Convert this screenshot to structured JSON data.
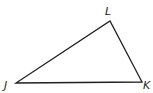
{
  "figure": {
    "type": "triangle",
    "stroke_color": "#231f20",
    "background": "#ffffff",
    "vertices": [
      {
        "name": "J",
        "x": 16,
        "y": 83
      },
      {
        "name": "K",
        "x": 142,
        "y": 82
      },
      {
        "name": "L",
        "x": 110,
        "y": 21
      }
    ],
    "labels": {
      "J": "J",
      "K": "K",
      "L": "L"
    }
  }
}
